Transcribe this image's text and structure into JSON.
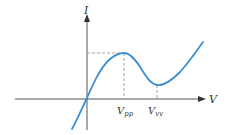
{
  "diagram": {
    "axes": {
      "x_label": "V",
      "y_label": "I"
    },
    "markers": [
      {
        "label_main": "V",
        "label_sub": "pp",
        "meaning": "peak voltage"
      },
      {
        "label_main": "V",
        "label_sub": "vv",
        "meaning": "valley voltage"
      }
    ],
    "colors": {
      "curve": "#3d8fd1",
      "axis": "#333333",
      "guide": "#888888"
    }
  }
}
